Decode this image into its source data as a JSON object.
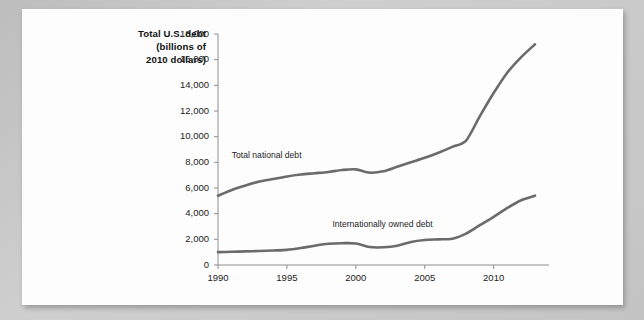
{
  "figure": {
    "axis_title_lines": [
      "Total U.S. debt",
      "(billions of",
      "2010 dollars)"
    ],
    "colors": {
      "page_background": "#c4c4c4",
      "card_background": "#fdfdfd",
      "line": "#6b6b6b",
      "axis": "#8e8e8e",
      "text": "#1d1d1d"
    }
  },
  "chart_data": {
    "type": "line",
    "title": "Total U.S. debt (billions of 2010 dollars)",
    "xlabel": "",
    "ylabel": "Total U.S. debt (billions of 2010 dollars)",
    "xlim": [
      1990,
      2013
    ],
    "ylim": [
      0,
      18000
    ],
    "yticks": [
      0,
      2000,
      4000,
      6000,
      8000,
      10000,
      12000,
      14000,
      16000,
      18000
    ],
    "ytick_labels": [
      "0",
      "2,000",
      "4,000",
      "6,000",
      "8,000",
      "10,000",
      "12,000",
      "14,000",
      "16,000",
      "18,000"
    ],
    "xticks": [
      1990,
      1995,
      2000,
      2005,
      2010
    ],
    "xtick_labels": [
      "1990",
      "1995",
      "2000",
      "2005",
      "2010"
    ],
    "grid": false,
    "legend": "inline-annotations",
    "x": [
      1990,
      1991,
      1992,
      1993,
      1994,
      1995,
      1996,
      1997,
      1998,
      1999,
      2000,
      2001,
      2002,
      2003,
      2004,
      2005,
      2006,
      2007,
      2008,
      2009,
      2010,
      2011,
      2012,
      2013
    ],
    "series": [
      {
        "name": "Total national debt",
        "label": "Total national debt",
        "label_x": 1991.0,
        "label_y": 8300,
        "values": [
          5400,
          5850,
          6200,
          6500,
          6700,
          6900,
          7050,
          7150,
          7250,
          7400,
          7450,
          7200,
          7300,
          7650,
          8000,
          8350,
          8750,
          9200,
          9700,
          11600,
          13400,
          15000,
          16200,
          17200
        ]
      },
      {
        "name": "Internationally owned debt",
        "label": "Internationally owned debt",
        "label_x": 1998.3,
        "label_y": 2950,
        "values": [
          1000,
          1030,
          1060,
          1090,
          1130,
          1180,
          1320,
          1500,
          1650,
          1700,
          1680,
          1400,
          1380,
          1500,
          1800,
          1950,
          2000,
          2050,
          2450,
          3100,
          3750,
          4450,
          5050,
          5400
        ]
      }
    ]
  }
}
